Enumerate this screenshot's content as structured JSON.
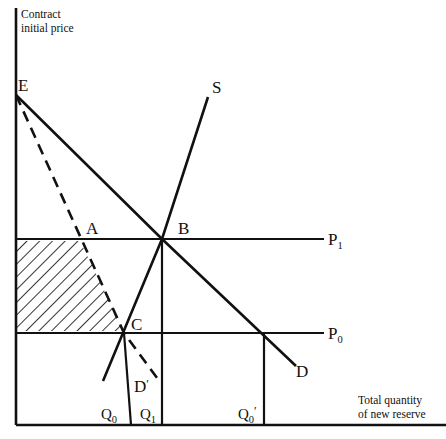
{
  "figure": {
    "background_color": "#ffffff",
    "ink_color": "#111111",
    "width": 446,
    "height": 439
  },
  "axes": {
    "y_axis": {
      "name": "vertical-axis",
      "title_line1": "Contract",
      "title_line2": "initial price",
      "x": 16,
      "y_top": 8,
      "y_bottom": 425
    },
    "x_axis": {
      "name": "horizontal-axis",
      "title_line1": "Total quantity",
      "title_line2": "of new reserve",
      "y": 425,
      "x_left": 16,
      "x_right": 446
    }
  },
  "price_levels": [
    {
      "id": "p1",
      "label": "P",
      "subscript": "1",
      "y": 239,
      "x_start": 16,
      "x_end": 324,
      "label_x": 328,
      "label_y": 245
    },
    {
      "id": "p0",
      "label": "P",
      "subscript": "0",
      "y": 333,
      "x_start": 16,
      "x_end": 324,
      "label_x": 328,
      "label_y": 339
    }
  ],
  "quantities": [
    {
      "id": "q0",
      "label": "Q",
      "subscript": "0",
      "prime": "",
      "line_x_top": 124,
      "line_x_bottom": 131,
      "line_y_top": 333,
      "line_y_bottom": 425,
      "label_x": 101,
      "label_y": 419
    },
    {
      "id": "q1",
      "label": "Q",
      "subscript": "1",
      "prime": "",
      "line_x_top": 162,
      "line_x_bottom": 162,
      "line_y_top": 239,
      "line_y_bottom": 425,
      "label_x": 140,
      "label_y": 419
    },
    {
      "id": "q0prime",
      "label": "Q",
      "subscript": "0",
      "prime": "′",
      "line_x_top": 264,
      "line_x_bottom": 264,
      "line_y_top": 333,
      "line_y_bottom": 425,
      "label_x": 238,
      "label_y": 419
    }
  ],
  "curves": [
    {
      "id": "supply",
      "label": "S",
      "label_x": 212,
      "label_y": 93,
      "points": "208,97 162,239 103,381",
      "dashed": false
    },
    {
      "id": "demand",
      "label": "D",
      "label_x": 296,
      "label_y": 377,
      "points": "16,95 162,239 296,366",
      "dashed": false
    },
    {
      "id": "demand-prime",
      "label": "D",
      "prime": "′",
      "label_x": 134,
      "label_y": 392,
      "points": "16,95 124,333 160,382",
      "dashed": true
    }
  ],
  "points": [
    {
      "id": "e",
      "label": "E",
      "x": 16,
      "y": 95,
      "label_x": 18,
      "label_y": 91
    },
    {
      "id": "a",
      "label": "A",
      "x": 80,
      "y": 239,
      "label_x": 86,
      "label_y": 234
    },
    {
      "id": "b",
      "label": "B",
      "x": 162,
      "y": 239,
      "label_x": 178,
      "label_y": 234
    },
    {
      "id": "c",
      "label": "C",
      "x": 124,
      "y": 333,
      "label_x": 131,
      "label_y": 330
    },
    {
      "id": "d-prime-end",
      "label": "",
      "x": 160,
      "y": 382,
      "label_x": 0,
      "label_y": 0
    }
  ],
  "shaded_region": {
    "id": "surplus-region",
    "name": "hatched-surplus-area",
    "polygon": "16,241 80,241 124,331 16,331",
    "hatch_angle_deg": 45,
    "hatch_color": "#111111"
  }
}
